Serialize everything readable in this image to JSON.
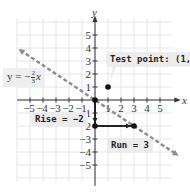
{
  "chart_data": {
    "type": "line",
    "title": "",
    "xlabel": "x",
    "ylabel": "y",
    "xlim": [
      -5,
      5
    ],
    "ylim": [
      -5,
      5
    ],
    "grid": true,
    "x_ticks": [
      -5,
      -4,
      -3,
      -2,
      -1,
      1,
      2,
      3,
      4,
      5
    ],
    "y_ticks": [
      5,
      4,
      3,
      2,
      1,
      -1,
      -2,
      -3,
      -4,
      -5
    ],
    "series": [
      {
        "name": "y = -2/3 x",
        "style": "dashed",
        "color": "#888888",
        "equation": "y = -(2/3)x",
        "slope": -0.6667,
        "intercept": 0,
        "points": [
          [
            -6,
            4
          ],
          [
            0,
            0
          ],
          [
            3,
            -2
          ],
          [
            6,
            -4
          ]
        ]
      }
    ],
    "points": [
      {
        "label": "origin",
        "x": 0,
        "y": 0
      },
      {
        "label": "Test point",
        "x": 1,
        "y": 1
      },
      {
        "label": "rise end",
        "x": 0,
        "y": -2
      },
      {
        "label": "run end",
        "x": 3,
        "y": -2
      }
    ],
    "segments": [
      {
        "name": "rise",
        "from": [
          0,
          0
        ],
        "to": [
          0,
          -2
        ],
        "value": -2
      },
      {
        "name": "run",
        "from": [
          0,
          -2
        ],
        "to": [
          3,
          -2
        ],
        "value": 3
      }
    ],
    "annotations": [
      "y = -2/3 x",
      "Test point: (1, 1)",
      "Rise = -2",
      "Run = 3"
    ]
  },
  "labels": {
    "x_axis": "x",
    "y_axis": "y",
    "equation_lhs": "y = −",
    "equation_num": "2",
    "equation_den": "3",
    "equation_var": "x",
    "test_point": "Test point: (1, 1)",
    "rise": "Rise = −2",
    "run": "Run = 3",
    "x_ticks": [
      "−5",
      "−4",
      "−3",
      "−2",
      "−1",
      "1",
      "2",
      "3",
      "4",
      "5"
    ],
    "y_ticks": [
      "5",
      "4",
      "3",
      "2",
      "1",
      "−1",
      "−2",
      "−3",
      "−4",
      "−5"
    ]
  },
  "colors": {
    "grid": "#e6e6e6",
    "axis": "#333333",
    "line": "#8c8c8c",
    "point": "#111111",
    "callout_bg": "#ececec"
  }
}
